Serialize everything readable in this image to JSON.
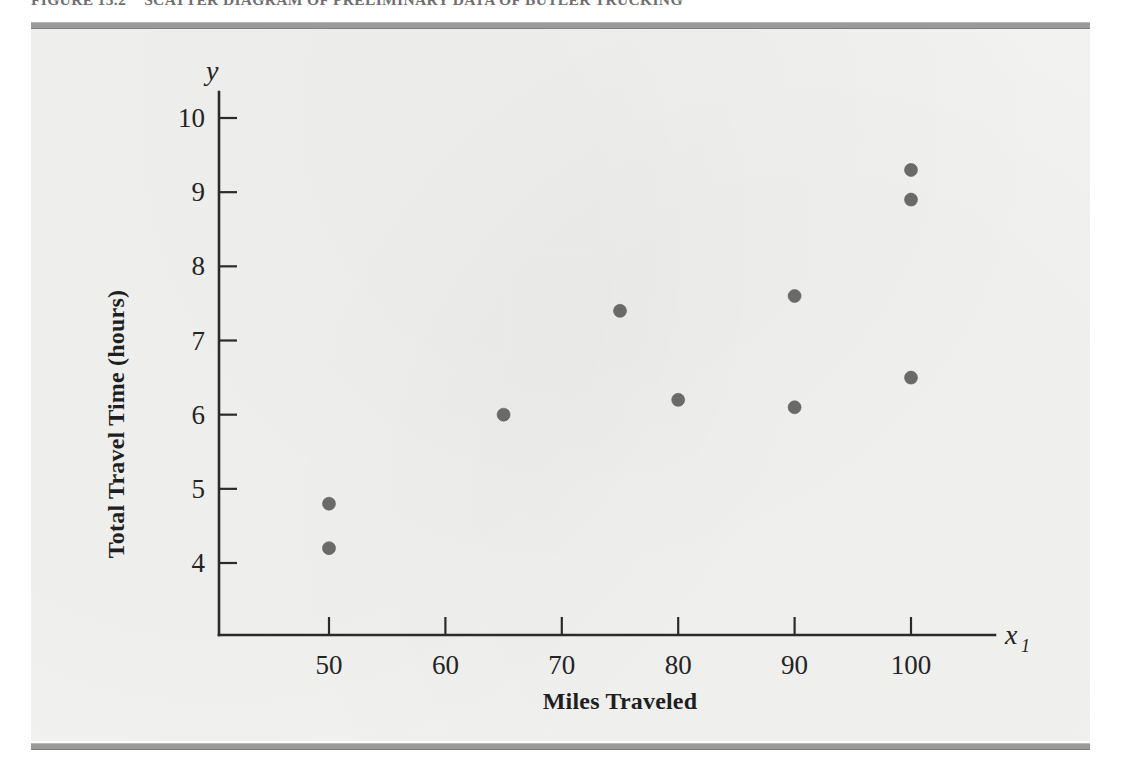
{
  "figure": {
    "caption_number": "FIGURE 15.2",
    "caption_text": "SCATTER DIAGRAM OF PRELIMINARY DATA OF BUTLER TRUCKING",
    "plate_color": "#f2f2f1",
    "rule_color": "#9a9a9a"
  },
  "chart_data": {
    "type": "scatter",
    "title": "SCATTER DIAGRAM OF PRELIMINARY DATA OF BUTLER TRUCKING",
    "xlabel": "Miles Traveled",
    "ylabel": "Total Travel Time (hours)",
    "x_variable_symbol": "x",
    "x_variable_subscript": "1",
    "y_variable_symbol": "y",
    "xticks": [
      50,
      60,
      70,
      80,
      90,
      100
    ],
    "yticks": [
      4,
      5,
      6,
      7,
      8,
      9,
      10
    ],
    "xlim": [
      42,
      107
    ],
    "ylim": [
      3.3,
      10.5
    ],
    "grid": false,
    "legend": false,
    "marker_color": "#6a6a6a",
    "marker_size_px": 13,
    "points": [
      {
        "x": 50,
        "y": 4.8
      },
      {
        "x": 50,
        "y": 4.2
      },
      {
        "x": 65,
        "y": 6.0
      },
      {
        "x": 75,
        "y": 7.4
      },
      {
        "x": 80,
        "y": 6.2
      },
      {
        "x": 90,
        "y": 7.6
      },
      {
        "x": 90,
        "y": 6.1
      },
      {
        "x": 100,
        "y": 9.3
      },
      {
        "x": 100,
        "y": 8.9
      },
      {
        "x": 100,
        "y": 6.5
      }
    ]
  }
}
